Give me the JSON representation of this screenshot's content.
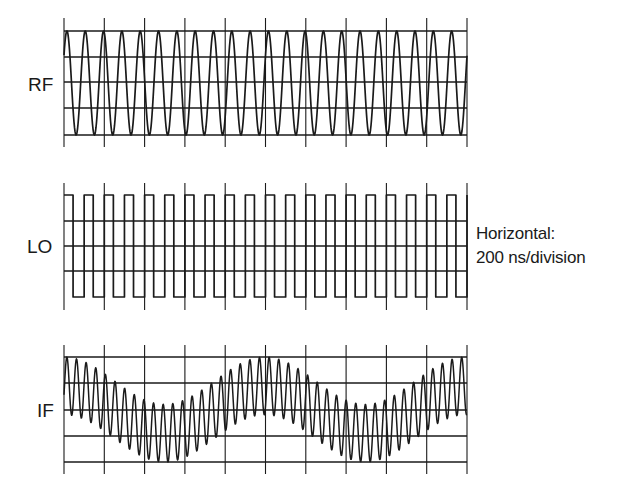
{
  "figure": {
    "colors": {
      "ink": "#1a1a1a",
      "background": "#ffffff"
    },
    "timebase_note": {
      "line1": "Horizontal:",
      "line2": "200 ns/division"
    },
    "grid": {
      "x_left": 64,
      "x_right": 467,
      "divisions": 10
    },
    "panels": [
      {
        "id": "rf",
        "label": "RF",
        "label_pos": [
          28,
          75
        ],
        "hlines": [
          31,
          57,
          82,
          108,
          135
        ],
        "tick_top": 18,
        "tick_bottom": 147,
        "wave": {
          "type": "sine",
          "top": 31,
          "bottom": 135,
          "period_px": 18.32,
          "phase": 0.16
        }
      },
      {
        "id": "lo",
        "label": "LO",
        "label_pos": [
          27,
          237
        ],
        "hlines": [
          221,
          246,
          271
        ],
        "tick_top": 183,
        "tick_bottom": 310,
        "wave": {
          "type": "square",
          "top": 195,
          "bottom": 297,
          "period_px": 20.15,
          "high_frac": 0.45
        }
      },
      {
        "id": "if",
        "label": "IF",
        "label_pos": [
          37,
          401
        ],
        "hlines": [
          357,
          383,
          410,
          436,
          462
        ],
        "tick_top": 345,
        "tick_bottom": 474,
        "wave": {
          "type": "mixed",
          "top": 357,
          "bottom": 462,
          "carrier_period_px": 9.63,
          "beat_period_px": 201,
          "carrier_weight": 0.55,
          "beat_weight": 0.45,
          "phase": 0.3
        }
      }
    ]
  }
}
